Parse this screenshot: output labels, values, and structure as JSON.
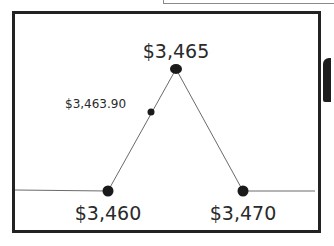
{
  "diagram": {
    "type": "peaked-line-diagram",
    "points": [
      {
        "id": "left-base",
        "label": "$3,460",
        "x": 108,
        "y": 191
      },
      {
        "id": "midpoint",
        "label": "$3,463.90",
        "x": 151,
        "y": 112
      },
      {
        "id": "peak",
        "label": "$3,465",
        "x": 176,
        "y": 69
      },
      {
        "id": "right-base",
        "label": "$3,470",
        "x": 243,
        "y": 191
      }
    ],
    "labels": {
      "peak": "$3,465",
      "midpoint": "$3,463.90",
      "left_base": "$3,460",
      "right_base": "$3,470"
    },
    "colors": {
      "frame": "#222222",
      "line": "#6a6a6a",
      "point": "#1a1a1a",
      "text": "#2a2a2a"
    }
  }
}
